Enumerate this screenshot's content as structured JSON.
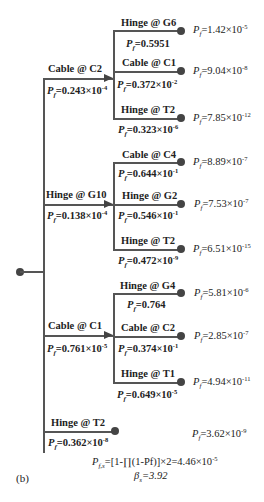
{
  "figure_label": "(b)",
  "symbols": {
    "P": "P",
    "f": "f",
    "eq": "=",
    "times": "×10"
  },
  "root": {
    "branches": [
      {
        "label": "Cable @ C2",
        "pf_mant": "0.243",
        "pf_exp": "-4",
        "children": [
          {
            "label": "Hinge @ G6",
            "pf_plain": "0.5951",
            "result_mant": "1.42",
            "result_exp": "-5"
          },
          {
            "label": "Cable @ C1",
            "pf_mant": "0.372",
            "pf_exp": "-2",
            "result_mant": "9.04",
            "result_exp": "-8"
          },
          {
            "label": "Hinge @ T2",
            "pf_mant": "0.323",
            "pf_exp": "-6",
            "result_mant": "7.85",
            "result_exp": "-12"
          }
        ]
      },
      {
        "label": "Hinge @ G10",
        "pf_mant": "0.138",
        "pf_exp": "-4",
        "children": [
          {
            "label": "Cable @ C4",
            "pf_mant": "0.644",
            "pf_exp": "-1",
            "result_mant": "8.89",
            "result_exp": "-7"
          },
          {
            "label": "Hinge @ G2",
            "pf_mant": "0.546",
            "pf_exp": "-1",
            "result_mant": "7.53",
            "result_exp": "-7"
          },
          {
            "label": "Hinge @ T2",
            "pf_mant": "0.472",
            "pf_exp": "-9",
            "result_mant": "6.51",
            "result_exp": "-15"
          }
        ]
      },
      {
        "label": "Cable @ C1",
        "pf_mant": "0.761",
        "pf_exp": "-5",
        "children": [
          {
            "label": "Hinge @ G4",
            "pf_plain": "0.764",
            "result_mant": "5.81",
            "result_exp": "-6"
          },
          {
            "label": "Cable @ C2",
            "pf_mant": "0.374",
            "pf_exp": "-1",
            "result_mant": "2.85",
            "result_exp": "-7"
          },
          {
            "label": "Hinge @ T1",
            "pf_mant": "0.649",
            "pf_exp": "-5",
            "result_mant": "4.94",
            "result_exp": "-11"
          }
        ]
      },
      {
        "label": "Hinge @ T2",
        "pf_mant": "0.362",
        "pf_exp": "-8",
        "result_mant": "3.62",
        "result_exp": "-9"
      }
    ]
  },
  "system": {
    "formula_prefix": "=[1-∏(1-Pf)]×2=4.46×10",
    "formula_exp": "-5",
    "sub_fs": "f,s",
    "beta_symbol": "β",
    "beta_sub": "s",
    "beta_value": "=3.92"
  }
}
